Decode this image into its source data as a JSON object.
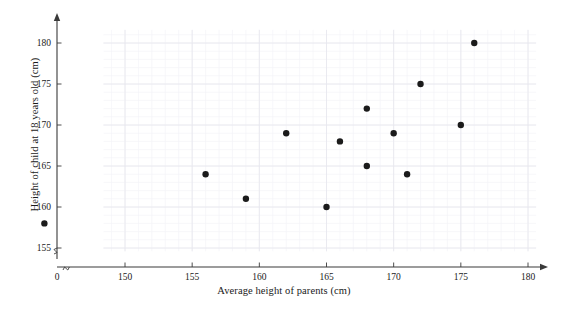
{
  "chart_data": {
    "type": "scatter",
    "title": "",
    "xlabel": "Average height of parents (cm)",
    "ylabel": "Height of child at 18 years old (cm)",
    "xlim": [
      148,
      181
    ],
    "ylim": [
      154,
      182
    ],
    "x_ticks": [
      0,
      150,
      155,
      160,
      165,
      170,
      175,
      180
    ],
    "y_ticks": [
      155,
      160,
      165,
      170,
      175,
      180
    ],
    "x_tick_labels": [
      "0",
      "150",
      "155",
      "160",
      "165",
      "170",
      "175",
      "180"
    ],
    "y_tick_labels": [
      "155",
      "160",
      "165",
      "170",
      "175",
      "180"
    ],
    "axis_break_x": true,
    "axis_break_y": true,
    "grid": true,
    "grid_minor": true,
    "grid_color": "#e8e8ee",
    "grid_minor_color": "#f4f4f8",
    "axis_color": "#3a3a3a",
    "marker_color": "#1b1b1b",
    "marker_size": 3.2,
    "legend": null,
    "points": [
      {
        "x": 144,
        "y": 158
      },
      {
        "x": 156,
        "y": 164
      },
      {
        "x": 159,
        "y": 161
      },
      {
        "x": 162,
        "y": 169
      },
      {
        "x": 165,
        "y": 160
      },
      {
        "x": 166,
        "y": 168
      },
      {
        "x": 168,
        "y": 172
      },
      {
        "x": 168,
        "y": 165
      },
      {
        "x": 170,
        "y": 169
      },
      {
        "x": 171,
        "y": 164
      },
      {
        "x": 172,
        "y": 175
      },
      {
        "x": 175,
        "y": 170
      },
      {
        "x": 176,
        "y": 180
      }
    ]
  },
  "axes": {
    "x_title": "Average height of parents (cm)",
    "y_title": "Height of child at 18 years old (cm)",
    "origin_label": "0"
  }
}
